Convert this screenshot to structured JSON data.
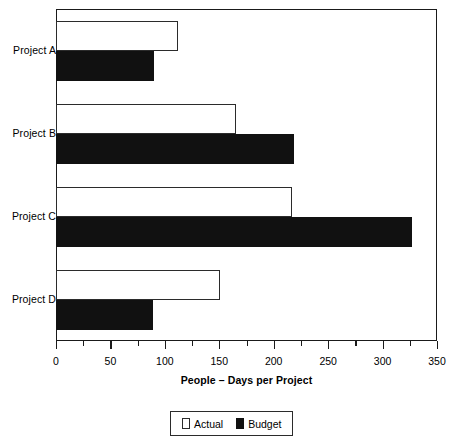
{
  "chart_data": {
    "type": "bar",
    "orientation": "horizontal",
    "title": "",
    "xlabel": "People – Days per Project",
    "ylabel": "",
    "categories": [
      "Project A",
      "Project B",
      "Project C",
      "Project D"
    ],
    "series": [
      {
        "name": "Actual",
        "color": "#ffffff",
        "values": [
          112,
          165,
          217,
          151
        ]
      },
      {
        "name": "Budget",
        "color": "#111111",
        "values": [
          90,
          219,
          327,
          89
        ]
      }
    ],
    "xlim": [
      0,
      350
    ],
    "xticks": [
      0,
      50,
      100,
      150,
      200,
      250,
      300,
      350
    ],
    "xtick_labels": [
      "0",
      "50",
      "100",
      "150",
      "200",
      "250",
      "300",
      "350"
    ],
    "minor_tick_step": 25,
    "grid": false,
    "legend_position": "bottom",
    "legend_entries": [
      "Actual",
      "Budget"
    ]
  },
  "axis": {
    "x_title": "People – Days per Project"
  },
  "legend": {
    "actual_label": "Actual",
    "budget_label": "Budget"
  }
}
